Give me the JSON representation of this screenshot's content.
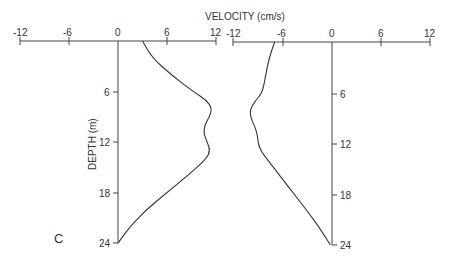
{
  "chart_data": {
    "type": "line",
    "title": "VELOCITY (cm/s)",
    "panel_label": "C",
    "xlabel": "VELOCITY (cm/s)",
    "ylabel": "DEPTH (m)",
    "panels": [
      {
        "name": "left",
        "x_ticks": [
          -12,
          -6,
          0,
          6,
          12
        ],
        "y_ticks": [
          6,
          12,
          18,
          24
        ],
        "xlim": [
          -12,
          12
        ],
        "ylim": [
          0,
          24
        ],
        "series": [
          {
            "name": "velocity profile (positive)",
            "depth": [
              0,
              2,
              4,
              6,
              7,
              8,
              9,
              10,
              11,
              12,
              13,
              14,
              16,
              18,
              20,
              22,
              24
            ],
            "velocity": [
              3,
              4.2,
              6.5,
              9.2,
              10.8,
              11.5,
              11.2,
              10.6,
              10.5,
              10.9,
              11.3,
              10.8,
              8.5,
              6.0,
              3.5,
              1.5,
              0
            ]
          }
        ]
      },
      {
        "name": "right",
        "x_ticks": [
          -12,
          -6,
          0,
          6,
          12
        ],
        "y_ticks": [
          6,
          12,
          18,
          24
        ],
        "xlim": [
          -12,
          12
        ],
        "ylim": [
          0,
          24
        ],
        "series": [
          {
            "name": "velocity profile (negative)",
            "depth": [
              0,
              2,
              4,
              6,
              7,
              8,
              9,
              10,
              11,
              12,
              13,
              14,
              16,
              18,
              20,
              22,
              24
            ],
            "velocity": [
              -7,
              -7.7,
              -8.1,
              -8.5,
              -9.4,
              -10,
              -9.9,
              -9.4,
              -9.1,
              -9.0,
              -8.6,
              -7.8,
              -6.2,
              -4.6,
              -3.0,
              -1.5,
              -0.2
            ]
          }
        ]
      }
    ]
  },
  "labels": {
    "title": "VELOCITY (cm/s)",
    "ylabel": "DEPTH (m)",
    "panel": "C"
  },
  "left_ticks_x": [
    "-12",
    "-6",
    "0",
    "6",
    "12"
  ],
  "right_ticks_x": [
    "-12",
    "-6",
    "0",
    "6",
    "12"
  ],
  "ticks_y": [
    "6",
    "12",
    "18",
    "24"
  ]
}
